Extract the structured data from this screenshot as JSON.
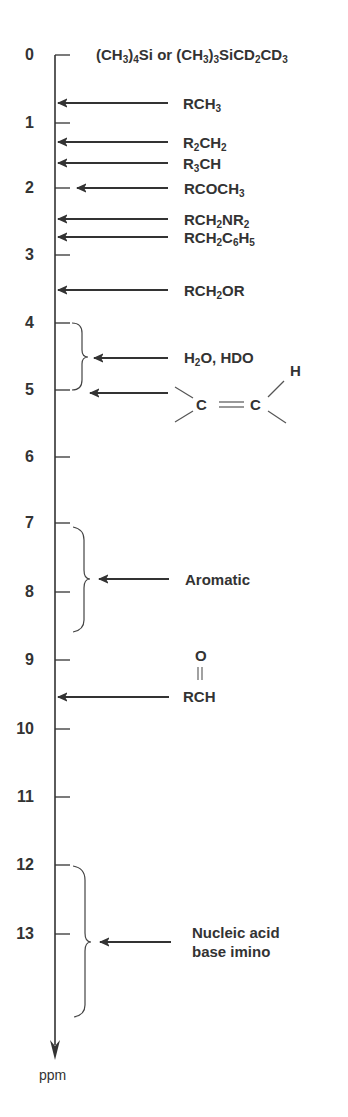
{
  "diagram": {
    "axis": {
      "unit_label": "ppm",
      "ticks": [
        "0",
        "1",
        "2",
        "3",
        "4",
        "5",
        "6",
        "7",
        "8",
        "9",
        "10",
        "11",
        "12",
        "13"
      ],
      "direction": "downfield-down"
    },
    "reference": {
      "label_parts": [
        {
          "t": "(CH"
        },
        {
          "s": "3"
        },
        {
          "t": ")"
        },
        {
          "s": "4"
        },
        {
          "t": "Si or (CH"
        },
        {
          "s": "3"
        },
        {
          "t": ")"
        },
        {
          "s": "3"
        },
        {
          "t": "SiCD"
        },
        {
          "s": "2"
        },
        {
          "t": "CD"
        },
        {
          "s": "3"
        }
      ],
      "ppm": 0
    },
    "entries": [
      {
        "id": "rch3",
        "ppm": 0.7,
        "label_parts": [
          {
            "t": "RCH"
          },
          {
            "s": "3"
          }
        ]
      },
      {
        "id": "r2ch2",
        "ppm": 1.3,
        "label_parts": [
          {
            "t": "R"
          },
          {
            "s": "2"
          },
          {
            "t": "CH"
          },
          {
            "s": "2"
          }
        ]
      },
      {
        "id": "r3ch",
        "ppm": 1.6,
        "label_parts": [
          {
            "t": "R"
          },
          {
            "s": "3"
          },
          {
            "t": "CH"
          }
        ]
      },
      {
        "id": "rcoch3",
        "ppm": 2.0,
        "label_parts": [
          {
            "t": "RCOCH"
          },
          {
            "s": "3"
          }
        ]
      },
      {
        "id": "rch2nr2",
        "ppm": 2.45,
        "label_parts": [
          {
            "t": "RCH"
          },
          {
            "s": "2"
          },
          {
            "t": "NR"
          },
          {
            "s": "2"
          }
        ]
      },
      {
        "id": "rch2c6h5",
        "ppm": 2.7,
        "label_parts": [
          {
            "t": "RCH"
          },
          {
            "s": "2"
          },
          {
            "t": "C"
          },
          {
            "s": "6"
          },
          {
            "t": "H"
          },
          {
            "s": "5"
          }
        ]
      },
      {
        "id": "rch2or",
        "ppm": 3.5,
        "label_parts": [
          {
            "t": "RCH"
          },
          {
            "s": "2"
          },
          {
            "t": "OR"
          }
        ]
      },
      {
        "id": "water",
        "ppm_range": [
          4,
          5
        ],
        "label_parts": [
          {
            "t": "H"
          },
          {
            "s": "2"
          },
          {
            "t": "O, HDO"
          }
        ]
      },
      {
        "id": "alkene",
        "ppm_range": [
          4,
          5
        ],
        "label": "C=C–H (vinyl)",
        "atoms": [
          "C",
          "C",
          "H"
        ]
      },
      {
        "id": "aromatic",
        "ppm_range": [
          7,
          8.6
        ],
        "label": "Aromatic"
      },
      {
        "id": "aldehyde",
        "ppm": 9.6,
        "label": "RCH",
        "carbonyl_atom": "O"
      },
      {
        "id": "imino",
        "ppm_range": [
          12,
          14.3
        ],
        "label_lines": [
          "Nucleic acid",
          "base  imino"
        ]
      }
    ],
    "colors": {
      "ink": "#333333",
      "background": "#ffffff"
    }
  }
}
